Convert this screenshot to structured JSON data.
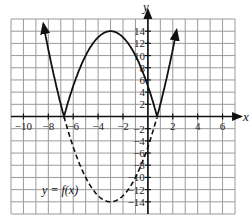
{
  "chart_data": {
    "type": "line",
    "title": "",
    "xlabel": "x",
    "ylabel": "y",
    "xlim": [
      -11,
      7
    ],
    "ylim": [
      -16,
      16
    ],
    "grid": true,
    "grid_step_x": 1,
    "grid_step_y": 2,
    "x_ticks": [
      -10,
      -8,
      -6,
      -4,
      -2,
      2,
      4,
      6
    ],
    "y_ticks": [
      14,
      12,
      10,
      8,
      6,
      4,
      2,
      -2,
      -4,
      -6,
      -8,
      -10,
      -12,
      -14
    ],
    "annotations": [
      {
        "text": "y = f(x)",
        "x": -8.5,
        "y": -12
      }
    ],
    "series": [
      {
        "name": "f(x) (dashed, below axis)",
        "style": "dashed",
        "expression": "f(x) = (x+3)^2 - 14",
        "x": [
          -6.74,
          -6,
          -5,
          -4,
          -3,
          -2,
          -1,
          0,
          0.74
        ],
        "values": [
          0,
          -5,
          -10,
          -13,
          -14,
          -13,
          -10,
          -5,
          0
        ]
      },
      {
        "name": "|f(x)| (solid)",
        "style": "solid",
        "expression": "y = |f(x)|",
        "x": [
          -8.4,
          -8,
          -7,
          -6.74,
          -6,
          -5,
          -4,
          -3,
          -2,
          -1,
          0,
          0.74,
          1,
          2,
          2.3
        ],
        "values": [
          15,
          11,
          2,
          0,
          5,
          10,
          13,
          14,
          13,
          10,
          5,
          0,
          2,
          11,
          14.9
        ],
        "arrows": [
          "start",
          "end"
        ]
      }
    ]
  },
  "labels": {
    "x_axis": "x",
    "y_axis": "y",
    "function": "y = f(x)"
  },
  "colors": {
    "grid": "#9a9a9a",
    "axes": "#111111",
    "curve": "#111111",
    "background": "#ffffff"
  }
}
